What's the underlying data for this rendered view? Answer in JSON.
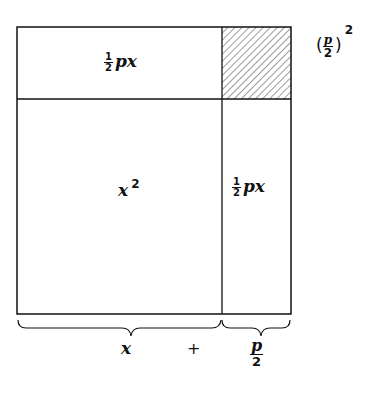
{
  "diagram": {
    "regions": {
      "top_left": {
        "coef_num": "1",
        "coef_den": "2",
        "expr": "px"
      },
      "top_right": {
        "pattern": "hatched",
        "label_open": "(",
        "label_num": "p",
        "label_den": "2",
        "label_close": ")",
        "label_exp": "2"
      },
      "bottom_left": {
        "expr": "x",
        "exp": "2"
      },
      "bottom_right": {
        "coef_num": "1",
        "coef_den": "2",
        "expr": "px"
      }
    },
    "braces": {
      "left": {
        "label": "x"
      },
      "plus": "+",
      "right": {
        "num": "p",
        "den": "2"
      }
    },
    "colors": {
      "line": "#111111",
      "background": "#ffffff"
    }
  }
}
